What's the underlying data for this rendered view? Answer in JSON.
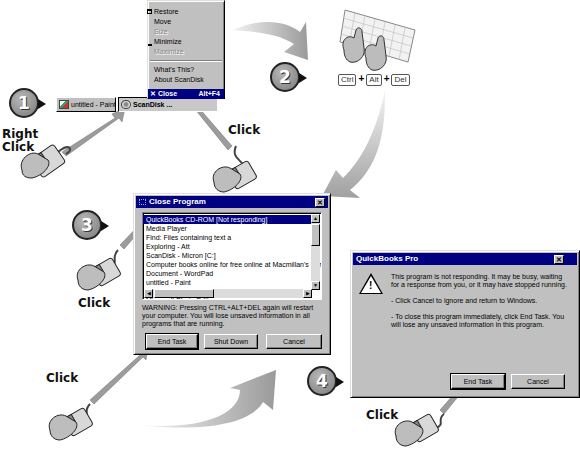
{
  "steps": [
    {
      "number": "1"
    },
    {
      "number": "2"
    },
    {
      "number": "3"
    },
    {
      "number": "4"
    }
  ],
  "callouts": {
    "right_click": "Right\nClick",
    "right_click_line1": "Right",
    "right_click_line2": "Click",
    "click_menu": "Click",
    "click_step3": "Click",
    "click_end_task": "Click",
    "click_step4": "Click"
  },
  "context_menu": {
    "items": [
      {
        "label": "Restore",
        "mnemonic": "R",
        "enabled": true
      },
      {
        "label": "Move",
        "mnemonic": "M",
        "enabled": true
      },
      {
        "label": "Size",
        "mnemonic": "S",
        "enabled": false
      },
      {
        "label": "Minimize",
        "mnemonic": "n",
        "enabled": true
      },
      {
        "label": "Maximize",
        "mnemonic": "x",
        "enabled": false
      },
      {
        "label": "What's This?",
        "mnemonic": "W",
        "enabled": true
      },
      {
        "label": "About ScanDisk",
        "mnemonic": "A",
        "enabled": true
      }
    ],
    "close": {
      "label": "Close",
      "shortcut": "Alt+F4",
      "icon": "close-x-icon"
    }
  },
  "taskbar": {
    "buttons": [
      {
        "label": "untitled - Paint",
        "icon": "paint-icon",
        "pressed": false
      },
      {
        "label": "ScanDisk ...",
        "icon": "scandisk-icon",
        "pressed": true
      }
    ]
  },
  "keyboard_shortcut": {
    "keys": [
      "Ctrl",
      "Alt",
      "Del"
    ],
    "separator": "+"
  },
  "close_program_dialog": {
    "title": "Close Program",
    "close_glyph": "✕",
    "tasks": [
      "QuickBooks CD-ROM [Not responding]",
      "Media Player",
      "Find: Files containing text a",
      "Exploring - Att",
      "ScanDisk - Micron [C:]",
      "Computer books online for free online at Macmillan's Perso",
      "Document - WordPad",
      "untitled - Paint",
      "Collage Capture <ORIGINAL.SET>",
      "Microsoft Photo Editor"
    ],
    "selected_index": 0,
    "warning": "WARNING: Pressing CTRL+ALT+DEL again will restart your computer. You will lose unsaved information in all programs that are running.",
    "buttons": {
      "end_task": "End Task",
      "shut_down": "Shut Down",
      "cancel": "Cancel"
    }
  },
  "quickbooks_dialog": {
    "title": "QuickBooks Pro",
    "close_glyph": "✕",
    "icon": "warning-icon",
    "message": "This program is not responding. It may be busy, waiting for a response from you, or it may have stopped running.",
    "bullet1": "-  Click Cancel to ignore and return to Windows.",
    "bullet2": "-  To close this program immediately, click End Task. You will lose any unsaved information in this program.",
    "buttons": {
      "end_task": "End Task",
      "cancel": "Cancel"
    }
  },
  "colors": {
    "titlebar_active": "#000080",
    "dialog_face": "#c0c0c0",
    "arrow_gray": "#a8a8a8",
    "bubble_gray": "#8c8c8c"
  }
}
